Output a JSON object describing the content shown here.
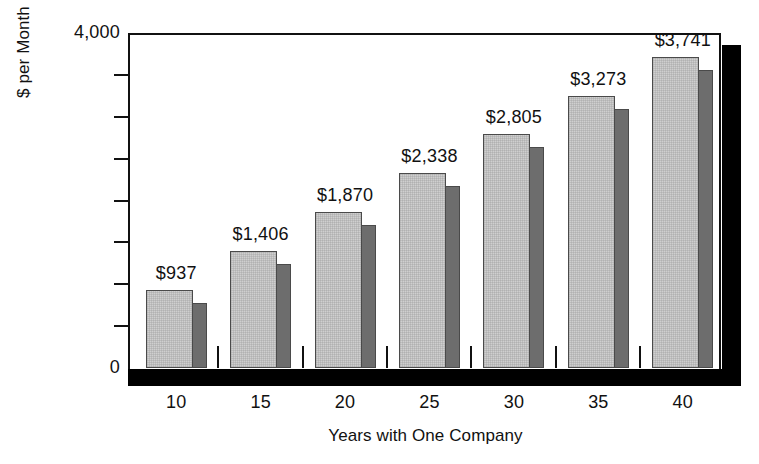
{
  "chart_data": {
    "type": "bar",
    "title": "",
    "xlabel": "Years with One Company",
    "ylabel": "$ per Month",
    "categories": [
      "10",
      "15",
      "20",
      "25",
      "30",
      "35",
      "40"
    ],
    "values": [
      937,
      1406,
      1870,
      2338,
      2805,
      3273,
      3741
    ],
    "data_labels": [
      "$937",
      "$1,406",
      "$1,870",
      "$2,338",
      "$2,805",
      "$3,273",
      "$3,741"
    ],
    "ylim": [
      0,
      4000
    ],
    "y_tick_labels": [
      "4,000",
      "0"
    ],
    "y_major_ticks": [
      0,
      4000
    ],
    "y_minor_tick_values": [
      500,
      1000,
      1500,
      2000,
      2500,
      3000,
      3500
    ],
    "grid": false,
    "legend": null,
    "style": "3d-bar",
    "colors": {
      "bar_front": "#cfcfcf",
      "bar_side": "#6d6d6d",
      "bar_outline": "#4a4a4a",
      "axis": "#111111",
      "shadow": "#000000",
      "background": "#ffffff",
      "text": "#111111"
    }
  }
}
